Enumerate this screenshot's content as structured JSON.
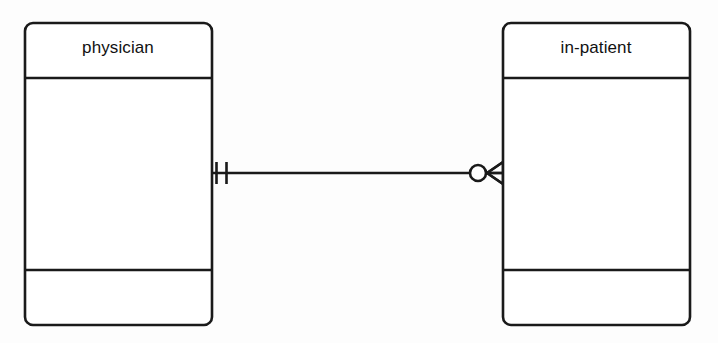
{
  "diagram": {
    "type": "entity-relationship-diagram",
    "notation": "crow's foot",
    "background_color": "#fdfdfd",
    "line_color": "#1a1a1a",
    "entities": [
      {
        "id": "physician",
        "label": "physician",
        "x": 25,
        "y": 23,
        "width": 187,
        "height": 302,
        "corner_radius": 8,
        "header_divider_y": 78,
        "footer_divider_y": 270,
        "title_center_x": 118,
        "title_center_y": 48
      },
      {
        "id": "in-patient",
        "label": "in-patient",
        "x": 503,
        "y": 23,
        "width": 187,
        "height": 302,
        "corner_radius": 8,
        "header_divider_y": 78,
        "footer_divider_y": 270,
        "title_center_x": 596,
        "title_center_y": 48
      }
    ],
    "relationship": {
      "id": "physician-to-in-patient",
      "line_y": 173,
      "line_x_start": 212,
      "line_x_end": 503,
      "source_entity": "physician",
      "target_entity": "in-patient",
      "source_cardinality": {
        "symbol": "one-and-only-one",
        "glyph": "||",
        "description": "exactly one",
        "tick_x_outer": 216,
        "tick_x_inner": 226,
        "tick_half_height": 11
      },
      "target_cardinality": {
        "symbol": "zero-or-many",
        "glyph": "O<",
        "description": "zero or many",
        "circle_center_x": 478,
        "circle_radius": 8,
        "crow_x_tip": 487,
        "crow_x_base": 503,
        "crow_half_height": 11
      }
    }
  }
}
